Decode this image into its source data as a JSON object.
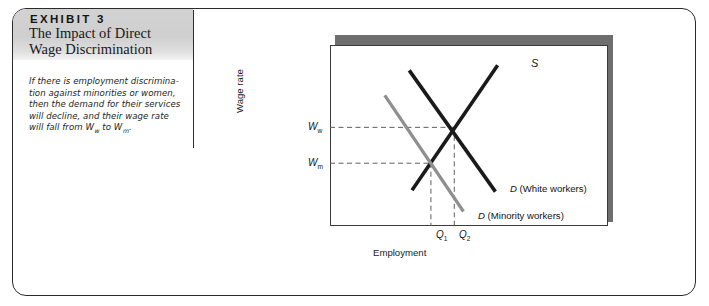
{
  "exhibit": {
    "kicker": "EXHIBIT 3",
    "title_line1": "The Impact of Direct",
    "title_line2": "Wage Discrimination",
    "caption_line1": "If there is employment discrimina-",
    "caption_line2": "tion against minorities or women,",
    "caption_line3": "then the demand for their services",
    "caption_line4": "will decline, and their wage rate",
    "caption_line5a": "will fall from W",
    "caption_sub1": "w",
    "caption_line5b": " to W",
    "caption_sub2": "m",
    "caption_line5c": "."
  },
  "chart_data": {
    "type": "line",
    "title": "The Impact of Direct Wage Discrimination",
    "xlabel": "Employment",
    "ylabel": "Wage rate",
    "grid": false,
    "legend": "inline-curve-labels",
    "xlim": [
      0,
      1
    ],
    "ylim": [
      0,
      1
    ],
    "x_tick_labels": [
      "Q1",
      "Q2"
    ],
    "y_tick_labels": [
      "Ww",
      "Wm"
    ],
    "annotations": {
      "supply_label": "S",
      "demand_white_label_italic": "D",
      "demand_white_label_rest": " (White workers)",
      "demand_minority_label_italic": "D",
      "demand_minority_label_rest": " (Minority workers)",
      "y_tick_ww_italic": "W",
      "y_tick_ww_sub": "w",
      "y_tick_wm_italic": "W",
      "y_tick_wm_sub": "m",
      "x_tick_q1_italic": "Q",
      "x_tick_q1_sub": "1",
      "x_tick_q2_italic": "Q",
      "x_tick_q2_sub": "2"
    },
    "series": [
      {
        "name": "S",
        "role": "supply",
        "color": "#1a1a1a",
        "points": [
          [
            0.295,
            0.198
          ],
          [
            0.603,
            0.888
          ]
        ]
      },
      {
        "name": "D (White workers)",
        "role": "demand-white",
        "color": "#1a1a1a",
        "points": [
          [
            0.285,
            0.86
          ],
          [
            0.595,
            0.19
          ]
        ]
      },
      {
        "name": "D (Minority workers)",
        "role": "demand-minority",
        "color": "#8f8f8f",
        "points": [
          [
            0.197,
            0.722
          ],
          [
            0.48,
            0.08
          ]
        ]
      }
    ],
    "equilibria": [
      {
        "label": "white",
        "x_tick": "Q2",
        "y_tick": "Ww",
        "x": 0.447,
        "y": 0.545
      },
      {
        "label": "minority",
        "x_tick": "Q1",
        "y_tick": "Wm",
        "x": 0.363,
        "y": 0.347
      }
    ]
  }
}
